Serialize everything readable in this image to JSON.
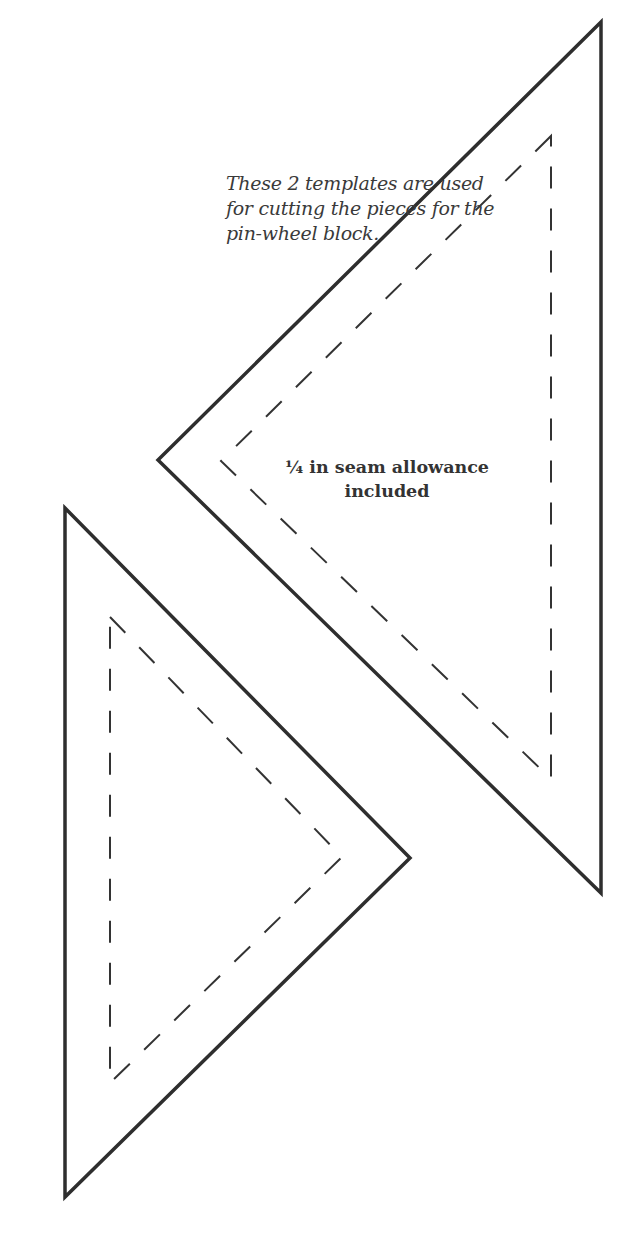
{
  "caption": {
    "lines": [
      "These 2 templates are used",
      "for cutting the pieces for the",
      "pin-wheel block."
    ]
  },
  "label": {
    "lines": [
      "¼ in seam allowance",
      "included"
    ]
  },
  "colors": {
    "background": "#ffffff",
    "outline": "#2e2e2e",
    "text": "#3a3a3a"
  },
  "templates": [
    {
      "name": "upper-right-triangle",
      "outer": [
        [
          601,
          22
        ],
        [
          158,
          460
        ],
        [
          601,
          893
        ]
      ],
      "inner": [
        [
          551,
          136
        ],
        [
          221,
          461
        ],
        [
          551,
          779
        ]
      ]
    },
    {
      "name": "lower-left-triangle",
      "outer": [
        [
          65,
          508
        ],
        [
          410,
          858
        ],
        [
          65,
          1197
        ]
      ],
      "inner": [
        [
          110,
          617
        ],
        [
          342,
          857
        ],
        [
          110,
          1083
        ]
      ]
    }
  ]
}
